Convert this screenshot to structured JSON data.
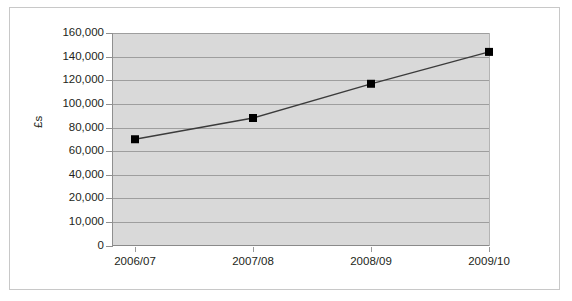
{
  "chart_data": {
    "type": "line",
    "title": "",
    "xlabel": "",
    "ylabel": "£s",
    "categories": [
      "2006/07",
      "2007/08",
      "2008/09",
      "2009/10"
    ],
    "values": [
      70000,
      88000,
      117000,
      144000
    ],
    "series": [
      {
        "name": "",
        "values": [
          70000,
          88000,
          117000,
          144000
        ]
      }
    ],
    "ytick_labels": [
      "160,000",
      "140,000",
      "120,000",
      "100,000",
      "80,000",
      "60,000",
      "40,000",
      "20,000",
      "10,000",
      "0"
    ],
    "ytick_values": [
      160000,
      140000,
      120000,
      100000,
      80000,
      60000,
      40000,
      20000,
      10000,
      0
    ],
    "ylim": [
      0,
      160000
    ],
    "grid": true,
    "legend": "none",
    "marker": "square",
    "colors": {
      "plot_background": "#d9d9d9",
      "gridline": "#9e9e9e",
      "line": "#3b3b3b",
      "marker": "#000000",
      "text": "#231f20",
      "frame_border": "#c8c8c8"
    }
  }
}
